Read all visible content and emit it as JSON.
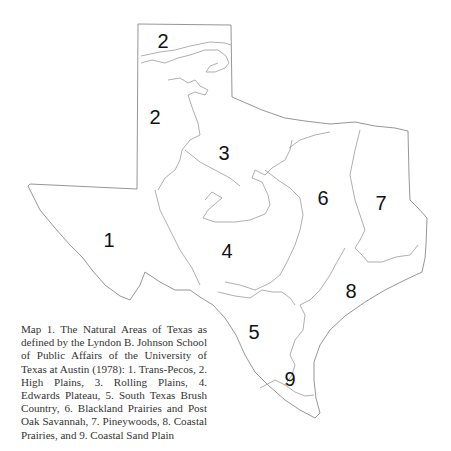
{
  "map": {
    "stroke_color": "#8a8a8a",
    "outline": "M138,24 L231,25 L232,97 L246,103 L262,110 L285,118 L305,121 L330,124 L355,122 L375,126 L395,128 L408,131 L409,175 L410,200 L418,208 L427,218 L426,245 L425,258 L422,272 L405,280 L385,290 L365,302 L345,316 L330,330 L320,345 L314,362 L314,380 L316,398 L320,413 L315,418 L300,410 L285,400 L268,385 L255,372 L245,355 L236,335 L225,318 L213,305 L200,297 L190,290 L175,290 L160,282 L145,272 L140,285 L130,300 L120,296 L105,285 L92,270 L83,258 L70,245 L55,228 L40,210 L28,186 L30,184 L137,189 Z",
    "boundaries": [
      "M141,56 L160,52 L175,50 L190,46 L210,42 L225,43 L231,45",
      "M141,63 L152,60 L165,63 L178,58 L190,55 L205,50 L218,50 L226,56 L229,63 L225,68 L215,72 L206,72 L210,66 L218,63",
      "M168,80 L180,78 L188,83 L195,80 L200,86 L208,90 L205,95 L195,92 L188,95",
      "M188,95 L193,110 L198,123 L200,135 L190,140 L182,150 L180,160 L175,170 L165,178 L158,190",
      "M185,150 L200,162 L215,170 L230,178 L240,186",
      "M205,200 L212,192 L222,198 L208,210 L203,218 L215,222 L235,222 L250,220 L265,214 L270,205 L268,195 L262,182 L252,178 L255,170 L265,175 L272,168 L285,160 L290,150 L292,140",
      "M265,170 L278,180 L290,188 L300,198 L303,215 L300,230 L295,245 L288,260 L280,275 L270,283 L255,290 L240,285 L225,282",
      "M155,190 L160,210 L170,230 L180,250 L192,268 L200,285",
      "M218,292 L235,296 L250,298 L262,290 L272,292 L282,292 L290,298 L295,305",
      "M289,148 L300,140 L315,135 L330,132",
      "M360,130 L355,150 L350,175 L355,200 L360,215 L365,230 L360,240 L355,248",
      "M345,248 L337,262 L330,275 L320,290 L310,300 L300,305",
      "M355,248 L362,255 L368,262 L382,262 L396,257 L410,255 L418,245",
      "M300,305 L305,315 L303,330 L295,340 L290,355 L295,365 L292,375 L285,385 L295,392 L305,396 L314,395",
      "M260,388 L275,380 L285,385"
    ],
    "regions": [
      {
        "id": "1",
        "label": "1",
        "x": 109,
        "y": 247
      },
      {
        "id": "2a",
        "label": "2",
        "x": 163,
        "y": 48
      },
      {
        "id": "2b",
        "label": "2",
        "x": 155,
        "y": 124
      },
      {
        "id": "3",
        "label": "3",
        "x": 224,
        "y": 160
      },
      {
        "id": "4",
        "label": "4",
        "x": 227,
        "y": 258
      },
      {
        "id": "5",
        "label": "5",
        "x": 254,
        "y": 339
      },
      {
        "id": "6",
        "label": "6",
        "x": 323,
        "y": 205
      },
      {
        "id": "7",
        "label": "7",
        "x": 381,
        "y": 210
      },
      {
        "id": "8",
        "label": "8",
        "x": 351,
        "y": 298
      },
      {
        "id": "9",
        "label": "9",
        "x": 290,
        "y": 386
      }
    ]
  },
  "caption": {
    "text": "Map 1. The Natural Areas of Texas as defined by the Lyndon B. Johnson School of Public Affairs of the University of Texas at Austin (1978): 1. Trans-Pecos, 2. High Plains, 3. Rolling Plains, 4. Edwards Plateau, 5. South Texas Brush Country, 6. Blackland Prairies and Post Oak Savannah, 7. Pineywoods, 8. Coastal Prairies, and 9. Coastal Sand Plain"
  }
}
